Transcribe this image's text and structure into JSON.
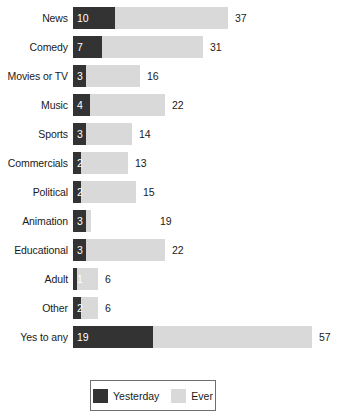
{
  "chart_data": {
    "type": "bar",
    "title": "",
    "subtitle": "",
    "xlabel": "",
    "ylabel": "",
    "orientation": "horizontal",
    "stacked": true,
    "grid": false,
    "legend_position": "bottom",
    "xlim": [
      0,
      57
    ],
    "categories": [
      "News",
      "Comedy",
      "Movies or TV",
      "Music",
      "Sports",
      "Commercials",
      "Political",
      "Animation",
      "Educational",
      "Adult",
      "Other",
      "Yes to any"
    ],
    "series": [
      {
        "name": "Yesterday",
        "color": "#333333",
        "values": [
          10,
          7,
          3,
          4,
          3,
          2,
          2,
          3,
          3,
          1,
          2,
          19
        ]
      },
      {
        "name": "Ever",
        "color": "#d9d9d9",
        "values": [
          37,
          31,
          16,
          22,
          14,
          13,
          15,
          19,
          22,
          6,
          6,
          57
        ]
      }
    ],
    "value_labels_inside": [
      "10",
      "7",
      "3",
      "4",
      "3",
      "2",
      "2",
      "3",
      "3",
      "1",
      "2",
      "19"
    ],
    "value_labels_outside": [
      "37",
      "31",
      "16",
      "22",
      "14",
      "13",
      "15",
      "19",
      "22",
      "6",
      "6",
      "57"
    ]
  },
  "legend": {
    "entries": [
      {
        "label": "Yesterday",
        "color": "#333333"
      },
      {
        "label": "Ever",
        "color": "#d9d9d9"
      }
    ]
  },
  "colors": {
    "yesterday": "#333333",
    "ever": "#d9d9d9",
    "text": "#1a1a1a",
    "inside_text": "#ffffff",
    "legend_border": "#6e6e6e",
    "background": "#ffffff"
  }
}
